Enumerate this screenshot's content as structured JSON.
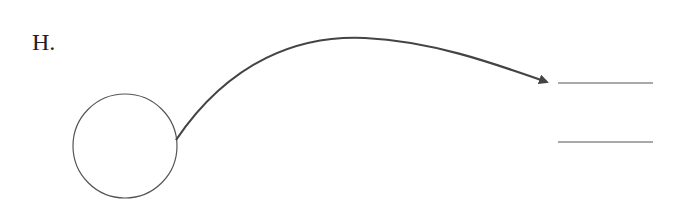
{
  "diagram": {
    "label": "H.",
    "shapes": {
      "circle": {
        "cx": 125,
        "cy": 146,
        "r": 52,
        "stroke": "#555555"
      },
      "arrow": {
        "from": [
          176,
          140
        ],
        "to": [
          547,
          82
        ],
        "peak": [
          355,
          38
        ],
        "stroke": "#444444"
      },
      "blank_lines": [
        {
          "x1": 558,
          "x2": 653,
          "y": 83
        },
        {
          "x1": 558,
          "x2": 653,
          "y": 142
        }
      ]
    },
    "colors": {
      "line": "#555555",
      "arrow": "#444444",
      "background": "#ffffff"
    }
  }
}
